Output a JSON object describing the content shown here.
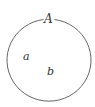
{
  "diagram": {
    "type": "set-diagram",
    "set": {
      "label": "A",
      "stroke_color": "#555555"
    },
    "elements": [
      {
        "label": "a"
      },
      {
        "label": "b"
      }
    ]
  }
}
